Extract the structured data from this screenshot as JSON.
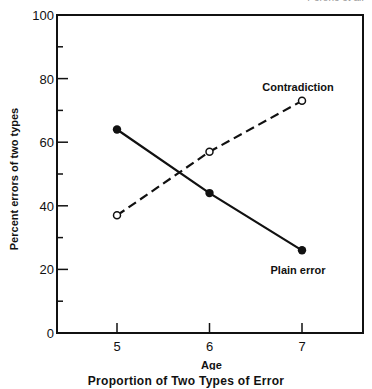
{
  "corner_text": "Perone et al.",
  "caption": "Proportion of Two Types of Error",
  "chart_data": {
    "type": "line",
    "title": "Proportion of Two Types of Error",
    "xlabel": "Age",
    "ylabel": "Percent errors of two types",
    "x": [
      5,
      6,
      7
    ],
    "xticks": [
      5,
      6,
      7
    ],
    "xlim": [
      4.33,
      7.67
    ],
    "ylim": [
      0,
      100
    ],
    "yticks": [
      0,
      20,
      40,
      60,
      80,
      100
    ],
    "yminor_ticks": [
      10,
      30,
      50,
      70,
      90
    ],
    "grid": false,
    "legend": "inline annotations",
    "series": [
      {
        "name": "Contradiction",
        "values": [
          37,
          57,
          73
        ],
        "style": "dashed",
        "marker": "open-circle"
      },
      {
        "name": "Plain error",
        "values": [
          64,
          44,
          26
        ],
        "style": "solid",
        "marker": "filled-circle"
      }
    ]
  }
}
